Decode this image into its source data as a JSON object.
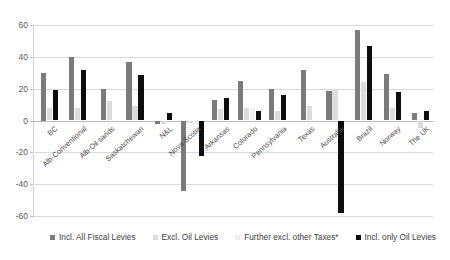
{
  "chart_data": {
    "type": "bar",
    "title": "",
    "subtitle": "",
    "xlabel": "",
    "ylabel": "",
    "ylim": [
      -60,
      60
    ],
    "yticks": [
      60,
      40,
      20,
      0,
      -20,
      -40,
      -60
    ],
    "grid": true,
    "legend_position": "bottom",
    "categories": [
      "BC",
      "Alb-Conventional",
      "Alb-Oil sands",
      "Saskatchewan",
      "N&L",
      "Nova Scotia",
      "Arkansas",
      "Colorado",
      "Pennsylvania",
      "Texas",
      "Australia",
      "Brazil",
      "Norway",
      "The UK"
    ],
    "series": [
      {
        "name": "Incl. All Fiscal Levies",
        "color": "#7b7b7b",
        "values": [
          30,
          40,
          20,
          37,
          -2,
          -44,
          13,
          25,
          20,
          32,
          18.5,
          57,
          29,
          5
        ]
      },
      {
        "name": "Excl. Oil Levies",
        "color": "#dcdcdc",
        "values": [
          8,
          8,
          12,
          9,
          -2,
          -1.5,
          7,
          8,
          6,
          9,
          20,
          24,
          8,
          -5
        ]
      },
      {
        "name": "Further excl. other Taxes*",
        "color": "#f0f0f0",
        "values": [
          null,
          null,
          null,
          null,
          null,
          -2,
          null,
          8,
          null,
          null,
          null,
          null,
          null,
          null
        ]
      },
      {
        "name": "Incl. only  Oil Levies",
        "color": "#0d0d0d",
        "values": [
          19,
          32,
          null,
          28.5,
          4.5,
          -22,
          14,
          6,
          16,
          null,
          -58,
          47,
          18,
          6
        ]
      }
    ]
  }
}
